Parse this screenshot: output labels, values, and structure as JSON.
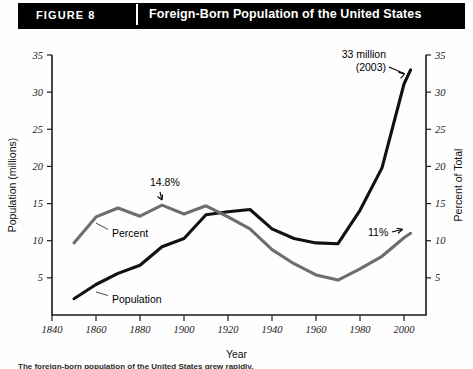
{
  "header": {
    "figure_tag": "FIGURE 8",
    "title": "Foreign-Born Population of the United States",
    "banner_color": "#000000"
  },
  "caption": {
    "text": "The foreign-born population of the United States grew rapidly."
  },
  "chart_data": {
    "type": "line",
    "title": "Foreign-Born Population of the United States",
    "xlabel": "Year",
    "ylabel": "Population (millions)",
    "y2label": "Percent of Total",
    "xlim": [
      1840,
      2010
    ],
    "ylim": [
      0,
      35
    ],
    "y2lim": [
      0,
      35
    ],
    "xticks": [
      1840,
      1860,
      1880,
      1900,
      1920,
      1940,
      1960,
      1980,
      2000
    ],
    "yticks": [
      5,
      10,
      15,
      20,
      25,
      30,
      35
    ],
    "y2ticks": [
      5,
      10,
      15,
      20,
      25,
      30,
      35
    ],
    "grid": false,
    "legend": "inline-labels",
    "series": [
      {
        "name": "Population",
        "label": "Population",
        "color": "#111111",
        "unit": "millions",
        "x": [
          1850,
          1860,
          1870,
          1880,
          1890,
          1900,
          1910,
          1920,
          1930,
          1940,
          1950,
          1960,
          1970,
          1980,
          1990,
          2000,
          2003
        ],
        "values": [
          2.2,
          4.1,
          5.6,
          6.7,
          9.2,
          10.3,
          13.5,
          13.9,
          14.2,
          11.6,
          10.3,
          9.7,
          9.6,
          14.1,
          19.8,
          31.1,
          33.0
        ]
      },
      {
        "name": "Percent",
        "label": "Percent",
        "color": "#6e6e6e",
        "unit": "percent of total",
        "x": [
          1850,
          1860,
          1870,
          1880,
          1890,
          1900,
          1910,
          1920,
          1930,
          1940,
          1950,
          1960,
          1970,
          1980,
          1990,
          2000,
          2003
        ],
        "values": [
          9.7,
          13.2,
          14.4,
          13.3,
          14.8,
          13.6,
          14.7,
          13.2,
          11.6,
          8.8,
          6.9,
          5.4,
          4.7,
          6.2,
          7.9,
          10.4,
          11.0
        ]
      }
    ],
    "annotations": [
      {
        "name": "peak-population-label",
        "text_line1": "33 million",
        "text_line2": "(2003)",
        "x": 2003,
        "y": 33.0
      },
      {
        "name": "percent-peak-label",
        "text": "14.8%",
        "x": 1890,
        "y": 14.8
      },
      {
        "name": "percent-end-label",
        "text": "11%",
        "x": 2003,
        "y": 11.0
      }
    ]
  }
}
